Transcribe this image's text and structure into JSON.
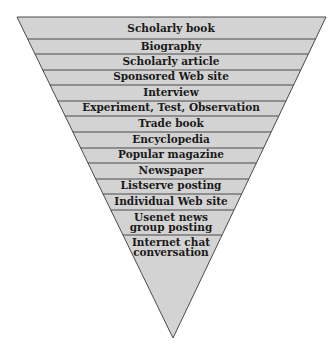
{
  "diagram": {
    "type": "inverted-pyramid",
    "colors": {
      "fill": "#d3d3d3",
      "stroke": "#4a4a4a",
      "text": "#1a1a1a",
      "background": "#ffffff"
    },
    "bands": [
      {
        "label": "Scholarly book"
      },
      {
        "label": "Biography"
      },
      {
        "label": "Scholarly article"
      },
      {
        "label": "Sponsored Web site"
      },
      {
        "label": "Interview"
      },
      {
        "label": "Experiment, Test, Observation"
      },
      {
        "label": "Trade book"
      },
      {
        "label": "Encyclopedia"
      },
      {
        "label": "Popular magazine"
      },
      {
        "label": "Newspaper"
      },
      {
        "label": "Listserve posting"
      },
      {
        "label": "Individual Web site"
      },
      {
        "label_line1": "Usenet news",
        "label_line2": "group posting"
      },
      {
        "label_line1": "Internet chat",
        "label_line2": "conversation"
      }
    ]
  }
}
